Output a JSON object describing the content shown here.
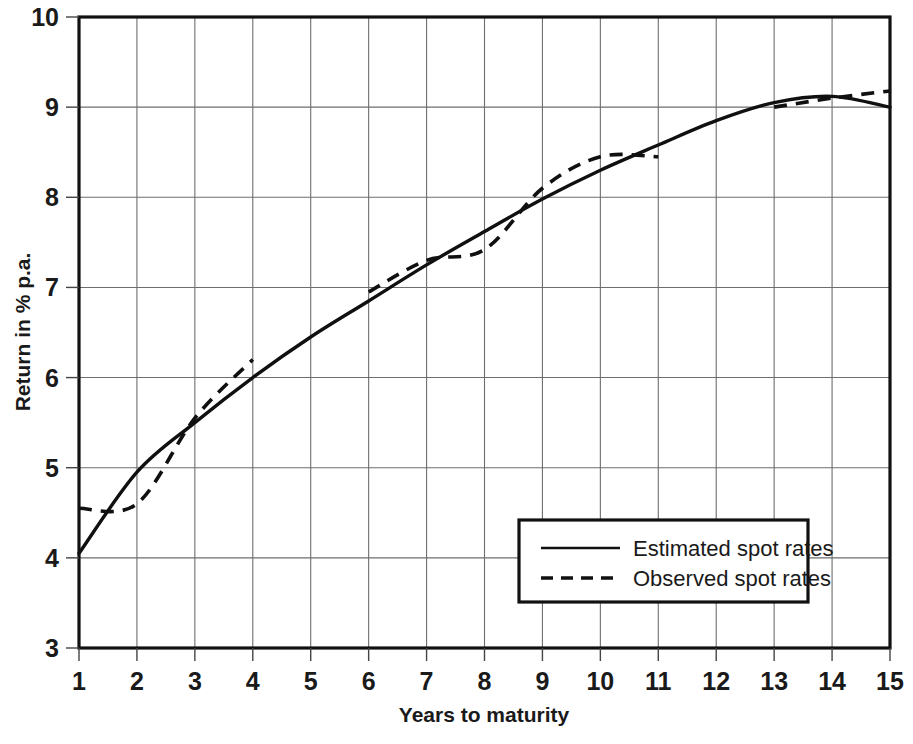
{
  "chart_data": {
    "type": "line",
    "title": "",
    "xlabel": "Years to maturity",
    "ylabel": "Return in % p.a.",
    "xlim": [
      1,
      15
    ],
    "ylim": [
      3,
      10
    ],
    "xticks": [
      "1",
      "2",
      "3",
      "4",
      "5",
      "6",
      "7",
      "8",
      "9",
      "10",
      "11",
      "12",
      "13",
      "14",
      "15"
    ],
    "yticks": [
      "3",
      "4",
      "5",
      "6",
      "7",
      "8",
      "9",
      "10"
    ],
    "grid": true,
    "legend_position": "lower right",
    "x": [
      1,
      2,
      3,
      4,
      5,
      6,
      7,
      8,
      9,
      10,
      11,
      12,
      13,
      14,
      15
    ],
    "series": [
      {
        "name": "Estimated spot rates",
        "style": "solid",
        "values": [
          4.05,
          4.95,
          5.5,
          6.0,
          6.45,
          6.85,
          7.25,
          7.62,
          7.98,
          8.3,
          8.58,
          8.85,
          9.05,
          9.12,
          9.0
        ]
      },
      {
        "name": "Observed spot rates",
        "style": "dashed",
        "segments": [
          {
            "x": [
              1,
              2,
              3,
              4
            ],
            "values": [
              4.55,
              4.6,
              5.55,
              6.2
            ]
          },
          {
            "x": [
              6,
              7,
              8,
              9,
              10,
              11
            ],
            "values": [
              6.95,
              7.3,
              7.42,
              8.1,
              8.45,
              8.45
            ]
          },
          {
            "x": [
              13,
              14,
              15
            ],
            "values": [
              9.0,
              9.1,
              9.18
            ]
          }
        ]
      }
    ]
  },
  "axes": {
    "y_label": "Return in % p.a.",
    "x_label": "Years to maturity",
    "y_ticks": [
      "10",
      "9",
      "8",
      "7",
      "6",
      "5",
      "4",
      "3"
    ],
    "x_ticks": [
      "1",
      "2",
      "3",
      "4",
      "5",
      "6",
      "7",
      "8",
      "9",
      "10",
      "11",
      "12",
      "13",
      "14",
      "15"
    ]
  },
  "legend": {
    "items": [
      {
        "label": "Estimated spot rates",
        "style": "solid"
      },
      {
        "label": "Observed spot rates",
        "style": "dashed"
      }
    ]
  }
}
